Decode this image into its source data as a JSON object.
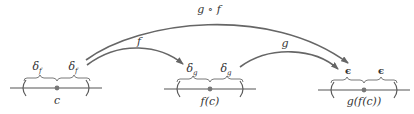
{
  "diagram": {
    "type": "function-composition-continuity",
    "intervals": [
      {
        "id": "domain",
        "center_label": "c",
        "half_width_label": "δ",
        "half_width_subscript": "f"
      },
      {
        "id": "middle",
        "center_label": "f(c)",
        "half_width_label": "δ",
        "half_width_subscript": "g"
      },
      {
        "id": "codomain",
        "center_label": "g(f(c))",
        "half_width_label": "ϵ",
        "half_width_subscript": ""
      }
    ],
    "arrows": [
      {
        "id": "f",
        "label": "f",
        "from": "domain",
        "to": "middle"
      },
      {
        "id": "g",
        "label": "g",
        "from": "middle",
        "to": "codomain"
      },
      {
        "id": "gof",
        "label": "g ∘ f",
        "from": "domain",
        "to": "codomain"
      }
    ],
    "colors": {
      "line": "#555555",
      "arrow": "#666666",
      "dot": "#777777",
      "text": "#333333"
    }
  }
}
